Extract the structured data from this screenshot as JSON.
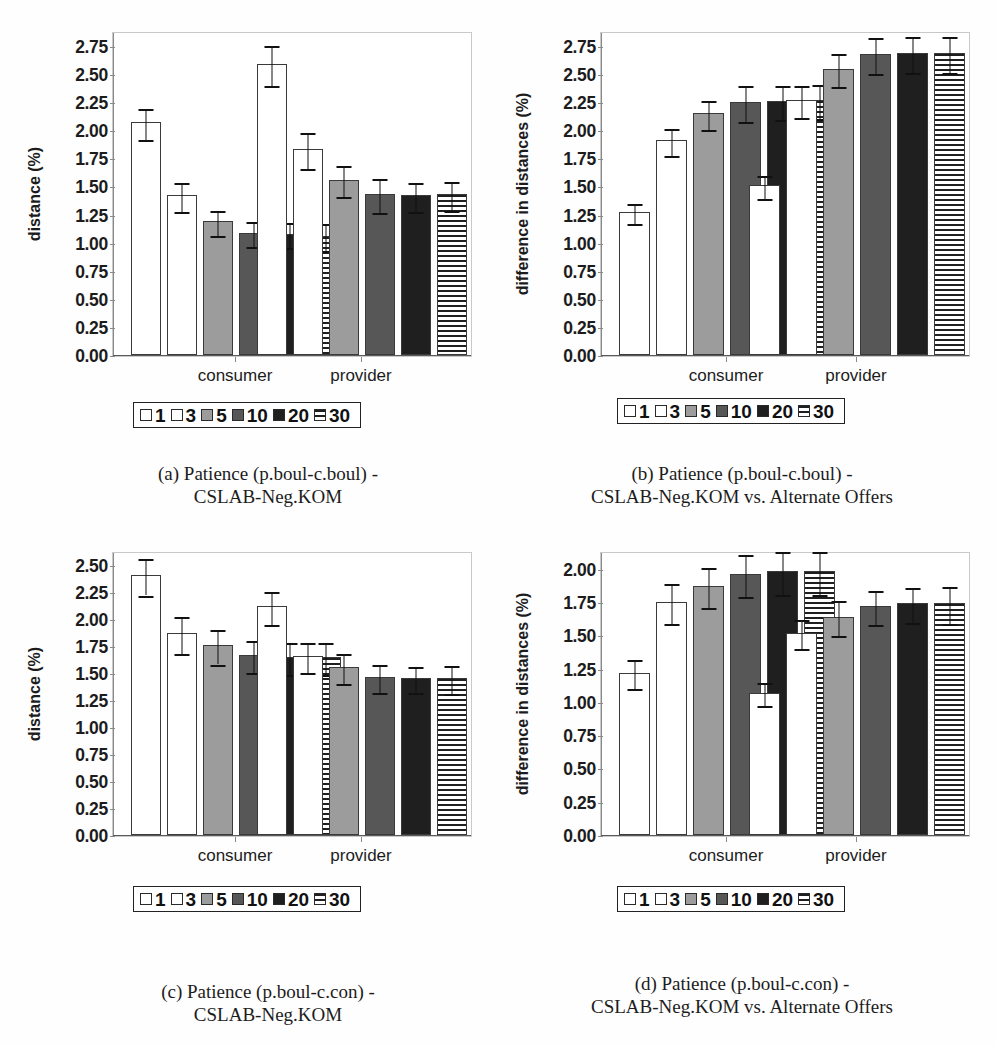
{
  "figure": {
    "legend_title": "bars legend",
    "series": [
      {
        "label": "1",
        "fill": "white",
        "fill_hex": "#ffffff"
      },
      {
        "label": "3",
        "fill": "white",
        "fill_hex": "#ffffff"
      },
      {
        "label": "5",
        "fill": "gray",
        "fill_hex": "#9c9c9c"
      },
      {
        "label": "10",
        "fill": "darkgray",
        "fill_hex": "#575757"
      },
      {
        "label": "20",
        "fill": "black",
        "fill_hex": "#1f1f1f"
      },
      {
        "label": "30",
        "fill": "stripe",
        "fill_hex": "#1f1f1f"
      }
    ],
    "groups": [
      "consumer",
      "provider"
    ]
  },
  "chart_data": [
    {
      "id": "a",
      "type": "bar",
      "title": "",
      "caption_line1": "(a) Patience (p.boul-c.boul) -",
      "caption_line2": "CSLAB-Neg.KOM",
      "xlabel": "",
      "ylabel": "distance (%)",
      "ylim": [
        0.0,
        2.875
      ],
      "yticks": [
        "0.00",
        "0.25",
        "0.50",
        "0.75",
        "1.00",
        "1.25",
        "1.50",
        "1.75",
        "2.00",
        "2.25",
        "2.50",
        "2.75"
      ],
      "ytick_values": [
        0.0,
        0.25,
        0.5,
        0.75,
        1.0,
        1.25,
        1.5,
        1.75,
        2.0,
        2.25,
        2.5,
        2.75
      ],
      "grid": false,
      "legend_position": "below-axes",
      "categories": [
        "consumer",
        "provider"
      ],
      "series": [
        {
          "name": "1",
          "values": [
            2.07,
            2.59
          ],
          "err": [
            0.14,
            0.18
          ]
        },
        {
          "name": "3",
          "values": [
            1.42,
            1.83
          ],
          "err": [
            0.13,
            0.16
          ]
        },
        {
          "name": "5",
          "values": [
            1.19,
            1.56
          ],
          "err": [
            0.11,
            0.14
          ]
        },
        {
          "name": "10",
          "values": [
            1.09,
            1.43
          ],
          "err": [
            0.11,
            0.15
          ]
        },
        {
          "name": "20",
          "values": [
            1.08,
            1.42
          ],
          "err": [
            0.11,
            0.13
          ]
        },
        {
          "name": "30",
          "values": [
            1.06,
            1.43
          ],
          "err": [
            0.12,
            0.13
          ]
        }
      ]
    },
    {
      "id": "b",
      "type": "bar",
      "title": "",
      "caption_line1": "(b) Patience (p.boul-c.boul) -",
      "caption_line2": "CSLAB-Neg.KOM vs. Alternate Offers",
      "xlabel": "",
      "ylabel": "difference in distances (%)",
      "ylim": [
        0.0,
        2.875
      ],
      "yticks": [
        "0.00",
        "0.25",
        "0.50",
        "0.75",
        "1.00",
        "1.25",
        "1.50",
        "1.75",
        "2.00",
        "2.25",
        "2.50",
        "2.75"
      ],
      "ytick_values": [
        0.0,
        0.25,
        0.5,
        0.75,
        1.0,
        1.25,
        1.5,
        1.75,
        2.0,
        2.25,
        2.5,
        2.75
      ],
      "grid": false,
      "legend_position": "below-axes",
      "categories": [
        "consumer",
        "provider"
      ],
      "series": [
        {
          "name": "1",
          "values": [
            1.27,
            1.51
          ],
          "err": [
            0.09,
            0.1
          ]
        },
        {
          "name": "3",
          "values": [
            1.91,
            2.27
          ],
          "err": [
            0.12,
            0.14
          ]
        },
        {
          "name": "5",
          "values": [
            2.15,
            2.55
          ],
          "err": [
            0.13,
            0.15
          ]
        },
        {
          "name": "10",
          "values": [
            2.25,
            2.68
          ],
          "err": [
            0.16,
            0.16
          ]
        },
        {
          "name": "20",
          "values": [
            2.26,
            2.69
          ],
          "err": [
            0.15,
            0.16
          ]
        },
        {
          "name": "30",
          "values": [
            2.27,
            2.69
          ],
          "err": [
            0.15,
            0.16
          ]
        }
      ]
    },
    {
      "id": "c",
      "type": "bar",
      "title": "",
      "caption_line1": "(c) Patience (p.boul-c.con) -",
      "caption_line2": "CSLAB-Neg.KOM",
      "xlabel": "",
      "ylabel": "distance (%)",
      "ylim": [
        0.0,
        2.625
      ],
      "yticks": [
        "0.00",
        "0.25",
        "0.50",
        "0.75",
        "1.00",
        "1.25",
        "1.50",
        "1.75",
        "2.00",
        "2.25",
        "2.50"
      ],
      "ytick_values": [
        0.0,
        0.25,
        0.5,
        0.75,
        1.0,
        1.25,
        1.5,
        1.75,
        2.0,
        2.25,
        2.5
      ],
      "grid": false,
      "legend_position": "below-axes",
      "categories": [
        "consumer",
        "provider"
      ],
      "series": [
        {
          "name": "1",
          "values": [
            2.41,
            2.12
          ],
          "err": [
            0.17,
            0.15
          ]
        },
        {
          "name": "3",
          "values": [
            1.87,
            1.66
          ],
          "err": [
            0.17,
            0.14
          ]
        },
        {
          "name": "5",
          "values": [
            1.76,
            1.56
          ],
          "err": [
            0.16,
            0.14
          ]
        },
        {
          "name": "10",
          "values": [
            1.67,
            1.47
          ],
          "err": [
            0.15,
            0.13
          ]
        },
        {
          "name": "20",
          "values": [
            1.65,
            1.46
          ],
          "err": [
            0.15,
            0.12
          ]
        },
        {
          "name": "30",
          "values": [
            1.65,
            1.46
          ],
          "err": [
            0.15,
            0.13
          ]
        }
      ]
    },
    {
      "id": "d",
      "type": "bar",
      "title": "",
      "caption_line1": "(d) Patience (p.boul-c.con) -",
      "caption_line2": "CSLAB-Neg.KOM vs. Alternate Offers",
      "xlabel": "",
      "ylabel": "difference in distances (%)",
      "ylim": [
        0.0,
        2.125
      ],
      "yticks": [
        "0.00",
        "0.25",
        "0.50",
        "0.75",
        "1.00",
        "1.25",
        "1.50",
        "1.75",
        "2.00"
      ],
      "ytick_values": [
        0.0,
        0.25,
        0.5,
        0.75,
        1.0,
        1.25,
        1.5,
        1.75,
        2.0
      ],
      "grid": false,
      "legend_position": "below-axes",
      "categories": [
        "consumer",
        "provider"
      ],
      "series": [
        {
          "name": "1",
          "values": [
            1.22,
            1.07
          ],
          "err": [
            0.11,
            0.09
          ]
        },
        {
          "name": "3",
          "values": [
            1.75,
            1.52
          ],
          "err": [
            0.15,
            0.11
          ]
        },
        {
          "name": "5",
          "values": [
            1.87,
            1.64
          ],
          "err": [
            0.15,
            0.13
          ]
        },
        {
          "name": "10",
          "values": [
            1.96,
            1.72
          ],
          "err": [
            0.16,
            0.13
          ]
        },
        {
          "name": "20",
          "values": [
            1.98,
            1.74
          ],
          "err": [
            0.16,
            0.13
          ]
        },
        {
          "name": "30",
          "values": [
            1.98,
            1.74
          ],
          "err": [
            0.16,
            0.14
          ]
        }
      ]
    }
  ]
}
